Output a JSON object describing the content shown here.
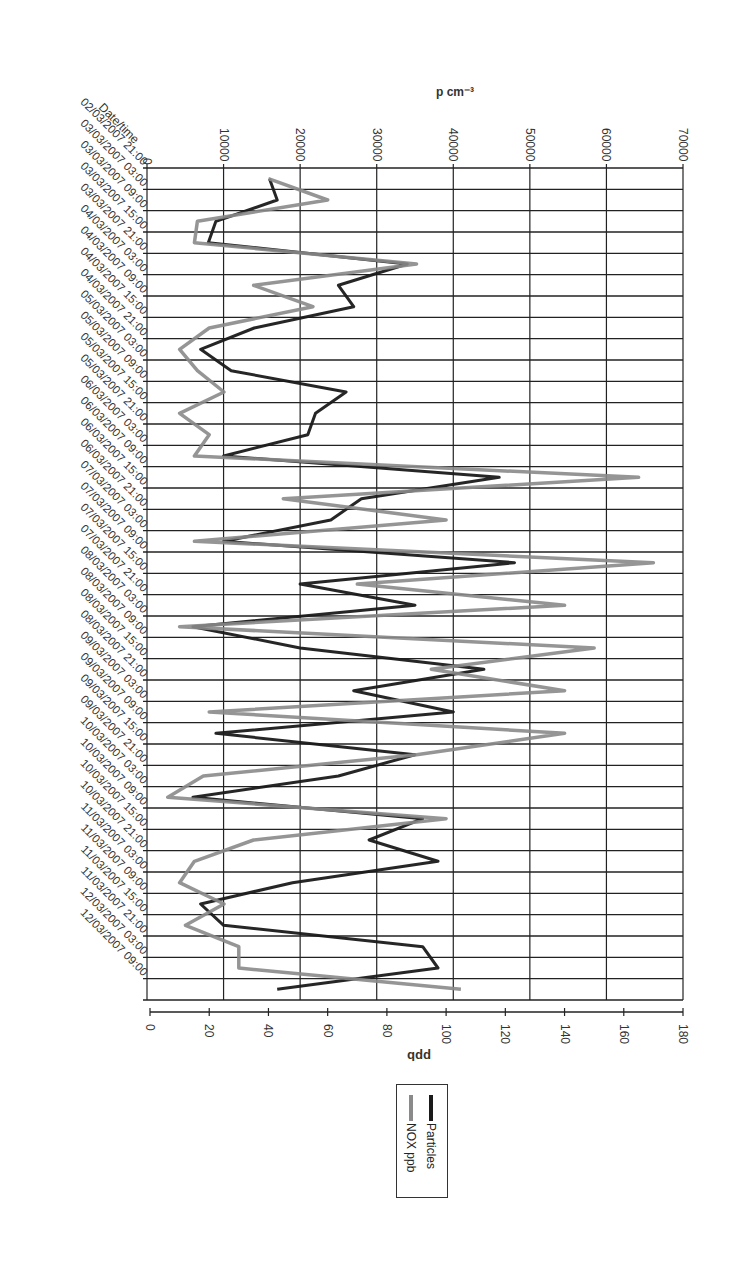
{
  "chart_data": {
    "type": "line",
    "orientation": "rotated-90-clockwise",
    "title": "",
    "xlabel": "Date/time",
    "ylabel_left": "p cm⁻³",
    "ylabel_right": "ppb",
    "y_left_ticks": [
      0,
      10000,
      20000,
      30000,
      40000,
      50000,
      60000,
      70000
    ],
    "y_left_range": [
      0,
      70000
    ],
    "y_right_ticks": [
      0,
      20,
      40,
      60,
      80,
      100,
      120,
      140,
      160,
      180
    ],
    "y_right_range": [
      0,
      180
    ],
    "grid": true,
    "legend_position": "right",
    "categories": [
      "02/03/2007 21:00",
      "03/03/2007 03:00",
      "03/03/2007 09:00",
      "03/03/2007 15:00",
      "03/03/2007 21:00",
      "04/03/2007 03:00",
      "04/03/2007 09:00",
      "04/03/2007 15:00",
      "04/03/2007 21:00",
      "05/03/2007 03:00",
      "05/03/2007 09:00",
      "05/03/2007 15:00",
      "05/03/2007 21:00",
      "06/03/2007 03:00",
      "06/03/2007 09:00",
      "06/03/2007 15:00",
      "06/03/2007 21:00",
      "07/03/2007 03:00",
      "07/03/2007 09:00",
      "07/03/2007 15:00",
      "07/03/2007 21:00",
      "08/03/2007 03:00",
      "08/03/2007 09:00",
      "08/03/2007 15:00",
      "08/03/2007 21:00",
      "09/03/2007 03:00",
      "09/03/2007 09:00",
      "09/03/2007 15:00",
      "09/03/2007 21:00",
      "10/03/2007 03:00",
      "10/03/2007 09:00",
      "10/03/2007 15:00",
      "10/03/2007 21:00",
      "11/03/2007 03:00",
      "11/03/2007 09:00",
      "11/03/2007 15:00",
      "11/03/2007 21:00",
      "12/03/2007 03:00",
      "12/03/2007 09:00"
    ],
    "series": [
      {
        "name": "Particles",
        "axis": "left",
        "color": "#1a1a1a",
        "values": [
          16000,
          17000,
          9000,
          8000,
          34000,
          25000,
          27000,
          14000,
          7000,
          11000,
          26000,
          22000,
          21000,
          10000,
          46000,
          28000,
          24000,
          10000,
          48000,
          20000,
          35000,
          6000,
          20000,
          44000,
          27000,
          40000,
          9000,
          35000,
          25000,
          6000,
          36000,
          29000,
          38000,
          19000,
          7000,
          10000,
          36000,
          38000,
          17000
        ]
      },
      {
        "name": "NOX ppb",
        "axis": "right",
        "color": "#8a8a8a",
        "values": [
          40,
          60,
          16,
          15,
          90,
          35,
          55,
          20,
          10,
          16,
          25,
          10,
          20,
          15,
          165,
          45,
          100,
          15,
          170,
          70,
          140,
          10,
          150,
          95,
          140,
          20,
          140,
          90,
          18,
          6,
          100,
          35,
          15,
          10,
          25,
          12,
          30,
          30,
          105
        ]
      }
    ]
  },
  "legend": {
    "items": [
      {
        "label": "Particles",
        "color": "#1a1a1a"
      },
      {
        "label": "NOX ppb",
        "color": "#8a8a8a"
      }
    ]
  }
}
